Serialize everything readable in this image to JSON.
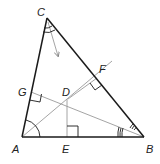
{
  "diagram": {
    "type": "triangle-with-bisectors-and-perpendiculars",
    "colors": {
      "main_line": "#1a1a1a",
      "aux_line": "#9a9a9a",
      "label": "#222222",
      "background": "#ffffff"
    },
    "points": {
      "A": {
        "label": "A",
        "x": 22,
        "y": 137
      },
      "B": {
        "label": "B",
        "x": 144,
        "y": 137
      },
      "C": {
        "label": "C",
        "x": 47,
        "y": 18
      },
      "D": {
        "label": "D",
        "x": 68,
        "y": 99
      },
      "E": {
        "label": "E",
        "x": 67,
        "y": 137
      },
      "F": {
        "label": "F",
        "x": 97,
        "y": 78
      },
      "G": {
        "label": "G",
        "x": 31,
        "y": 92
      }
    },
    "labels": {
      "A": "A",
      "B": "B",
      "C": "C",
      "D": "D",
      "E": "E",
      "F": "F",
      "G": "G"
    },
    "segments": [
      {
        "from": "A",
        "to": "B",
        "style": "main"
      },
      {
        "from": "B",
        "to": "C",
        "style": "main"
      },
      {
        "from": "C",
        "to": "A",
        "style": "main"
      },
      {
        "from": "D",
        "to": "E",
        "style": "aux"
      },
      {
        "from": "D",
        "to": "F",
        "style": "aux"
      },
      {
        "from": "D",
        "to": "G",
        "style": "aux"
      },
      {
        "from": "A",
        "to": "D",
        "style": "aux",
        "note": "angle bisector of A"
      },
      {
        "from": "B",
        "to": "D",
        "style": "aux",
        "note": "angle bisector of B"
      }
    ],
    "right_angles": [
      "E",
      "F",
      "G"
    ],
    "angle_marks": {
      "A": "single arc (bisected, congruent halves)",
      "B": "triple arc (bisected, congruent halves)",
      "C": "double arc (bisected, arrow indicates bisector direction)"
    },
    "arrow": {
      "from": "C",
      "direction": "toward D",
      "meaning": "angle bisector from C"
    }
  }
}
